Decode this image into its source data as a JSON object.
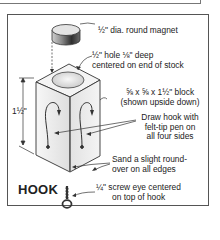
{
  "diagram": {
    "title": "HOOK",
    "dimension_label": "1½\"",
    "callouts": [
      {
        "id": "magnet",
        "lines": [
          "½\" dia. round magnet"
        ]
      },
      {
        "id": "hole",
        "lines": [
          "½\" hole ⅛\" deep",
          "centered on end of stock"
        ]
      },
      {
        "id": "block",
        "lines": [
          "⅝ x ⅝ x 1½\" block",
          "(shown upside down)"
        ]
      },
      {
        "id": "draw",
        "lines": [
          "Draw hook with",
          "felt-tip pen on",
          "all four sides"
        ]
      },
      {
        "id": "sand",
        "lines": [
          "Sand a slight round-",
          "over on all edges"
        ]
      },
      {
        "id": "screw-eye",
        "lines": [
          "¼\" screw eye centered",
          "on top of hook"
        ]
      }
    ],
    "colors": {
      "line": "#333333",
      "block_light": "#f4f4f4",
      "block_shade": "#d6d6d6",
      "magnet_top": "#e8e8e8",
      "magnet_side": "#555555"
    }
  }
}
